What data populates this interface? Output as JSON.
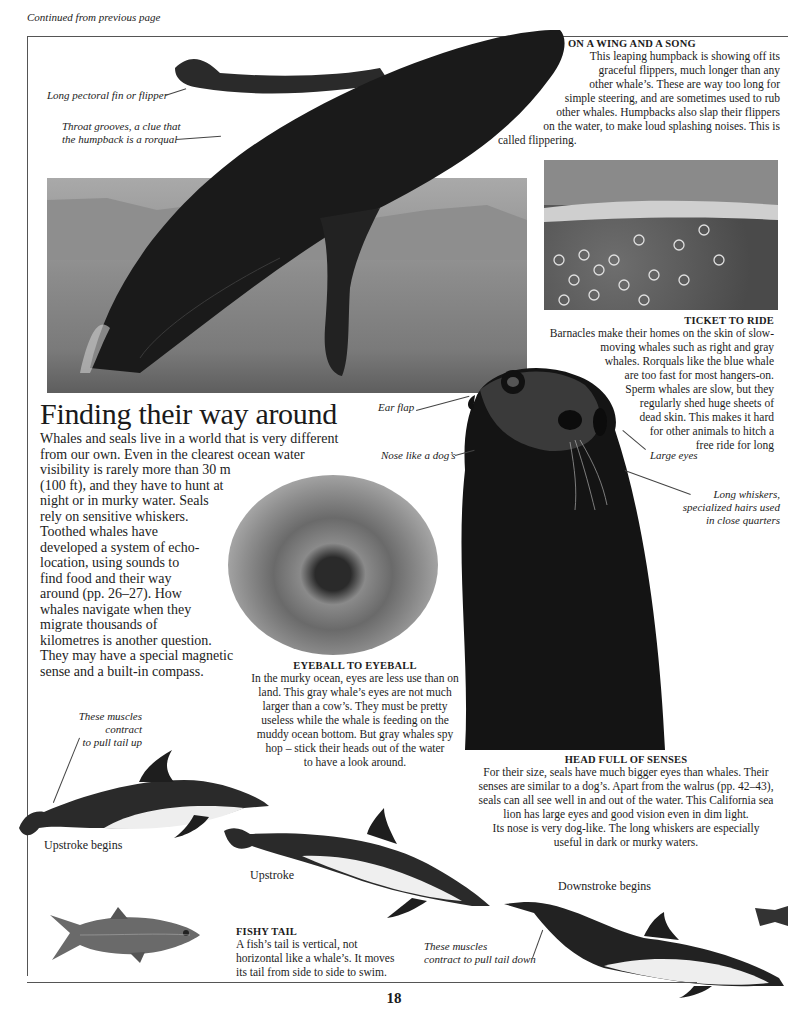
{
  "page": {
    "continued_note": "Continued from previous page",
    "page_number": "18"
  },
  "main": {
    "heading": "Finding their way around",
    "intro": [
      "Whales and seals live in a world that is very different",
      "from our own. Even in the clearest ocean water",
      "visibility is rarely more than 30 m",
      "(100 ft), and they have to hunt at",
      "night or in murky water. Seals",
      "rely on sensitive whiskers.",
      "Toothed whales have",
      "developed a system of echo-",
      "location, using sounds to",
      "find food and their way",
      "around (pp. 26–27). How",
      "whales navigate when they",
      "migrate thousands of",
      "kilometres is another question.",
      "They may have a special magnetic",
      "sense and a built-in compass."
    ]
  },
  "captions": {
    "wing_song": {
      "title": "On a wing and a song",
      "lines": [
        "This leaping humpback is showing off its",
        "graceful flippers, much longer than any",
        "other whale’s. These are way too long for",
        "simple steering, and are sometimes used to rub",
        "other whales. Humpbacks also slap their flippers",
        "on the water, to make loud splashing noises. This is",
        "called flippering."
      ]
    },
    "ticket": {
      "title": "Ticket to ride",
      "lines": [
        "Barnacles make their homes on the skin of slow-",
        "moving whales such as right and gray",
        "whales. Rorquals like the blue whale",
        "are too fast for most hangers-on.",
        "Sperm whales are slow, but they",
        "regularly shed huge sheets of",
        "dead skin. This makes it hard",
        "for other animals to hitch a",
        "free ride for long"
      ]
    },
    "eyeball": {
      "title": "Eyeball to eyeball",
      "lines": [
        "In the murky ocean, eyes are less use than on",
        "land. This gray whale’s eyes are not much",
        "larger than a cow’s. They must be pretty",
        "useless while the whale is feeding on the",
        "muddy ocean bottom. But gray whales spy",
        "hop – stick their heads out of the water",
        "to have a look around."
      ]
    },
    "head_senses": {
      "title": "Head full of senses",
      "lines": [
        "For their size, seals have much bigger eyes than whales. Their",
        "senses are similar to a dog’s. Apart from the walrus (pp. 42–43),",
        "seals can all see well in and out of the water. This California sea",
        "lion has large eyes and good vision even in dim light.",
        "Its nose is very dog-like. The long whiskers are especially",
        "useful in dark or murky waters."
      ]
    },
    "fishy_tail": {
      "title": "Fishy tail",
      "lines": [
        "A fish’s tail is vertical, not",
        "horizontal like a whale’s. It moves",
        "its tail from side to side to swim."
      ]
    }
  },
  "labels": {
    "pectoral_fin": "Long pectoral fin or flipper",
    "throat_grooves": [
      "Throat grooves, a clue that",
      "the humpback is a rorqual"
    ],
    "ear_flap": "Ear flap",
    "nose_dog": "Nose like a dog’s",
    "large_eyes": "Large eyes",
    "whiskers": [
      "Long whiskers,",
      "specialized hairs used",
      "in close quarters"
    ],
    "muscles_up": [
      "These muscles contract",
      "to pull tail up"
    ],
    "muscles_down": [
      "These muscles",
      "contract to pull tail down"
    ],
    "upstroke_begins": "Upstroke begins",
    "upstroke": "Upstroke",
    "downstroke_begins": "Downstroke begins"
  },
  "images": {
    "humpback": "breaching-humpback-whale-photo",
    "barnacles": "barnacles-on-whale-skin-photo",
    "gray_whale_eye": "gray-whale-eye-photo",
    "sea_lion": "california-sea-lion-photo",
    "fish": "fish-illustration",
    "dolphins": "dolphin-swimming-sequence-illustration"
  }
}
